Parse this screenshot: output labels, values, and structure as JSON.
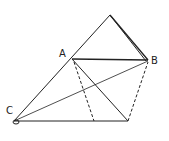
{
  "diagram": {
    "type": "geometry",
    "labels": {
      "A": "A",
      "B": "B",
      "C": "C"
    },
    "points": {
      "apex": [
        110,
        15
      ],
      "A": [
        72,
        59
      ],
      "B": [
        148,
        60
      ],
      "C": [
        14,
        121
      ],
      "D": [
        128,
        121
      ],
      "E": [
        94,
        121
      ]
    },
    "colors": {
      "line": "#222222",
      "background": "#ffffff"
    }
  }
}
